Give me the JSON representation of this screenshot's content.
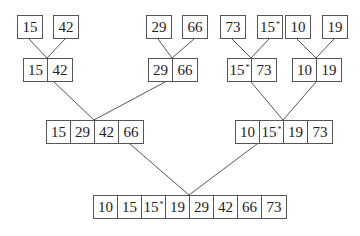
{
  "diagram": {
    "title": "",
    "levels": [
      {
        "name": "level-0-singletons",
        "arrays": [
          {
            "x": 17,
            "y": 15,
            "values": [
              "15"
            ]
          },
          {
            "x": 53,
            "y": 15,
            "values": [
              "42"
            ]
          },
          {
            "x": 146,
            "y": 15,
            "values": [
              "29"
            ]
          },
          {
            "x": 182,
            "y": 15,
            "values": [
              "66"
            ]
          },
          {
            "x": 220,
            "y": 15,
            "values": [
              "73"
            ]
          },
          {
            "x": 257,
            "y": 15,
            "values": [
              "15*"
            ]
          },
          {
            "x": 285,
            "y": 15,
            "values": [
              "10"
            ]
          },
          {
            "x": 322,
            "y": 15,
            "values": [
              "19"
            ]
          }
        ]
      },
      {
        "name": "level-1-pairs",
        "arrays": [
          {
            "x": 23,
            "y": 58,
            "values": [
              "15",
              "42"
            ]
          },
          {
            "x": 148,
            "y": 58,
            "values": [
              "29",
              "66"
            ]
          },
          {
            "x": 227,
            "y": 58,
            "values": [
              "15*",
              "73"
            ]
          },
          {
            "x": 292,
            "y": 58,
            "values": [
              "10",
              "19"
            ]
          }
        ]
      },
      {
        "name": "level-2-quads",
        "arrays": [
          {
            "x": 46,
            "y": 120,
            "values": [
              "15",
              "29",
              "42",
              "66"
            ]
          },
          {
            "x": 235,
            "y": 120,
            "values": [
              "10",
              "15*",
              "19",
              "73"
            ]
          }
        ]
      },
      {
        "name": "level-3-final",
        "arrays": [
          {
            "x": 93,
            "y": 195,
            "values": [
              "10",
              "15",
              "15*",
              "19",
              "29",
              "42",
              "66",
              "73"
            ]
          }
        ]
      }
    ],
    "edges": [
      [
        29,
        39,
        47,
        58
      ],
      [
        65,
        39,
        47,
        58
      ],
      [
        158,
        39,
        172,
        58
      ],
      [
        194,
        39,
        172,
        58
      ],
      [
        232,
        39,
        251,
        58
      ],
      [
        269,
        39,
        251,
        58
      ],
      [
        297,
        39,
        316,
        58
      ],
      [
        334,
        39,
        316,
        58
      ],
      [
        54,
        82,
        94,
        120
      ],
      [
        165,
        82,
        94,
        120
      ],
      [
        251,
        82,
        283,
        120
      ],
      [
        316,
        82,
        283,
        120
      ],
      [
        130,
        144,
        189,
        195
      ],
      [
        257,
        144,
        189,
        195
      ]
    ],
    "line_color": "#555555",
    "annotation": "* marks duplicate key 15 (stability)"
  }
}
